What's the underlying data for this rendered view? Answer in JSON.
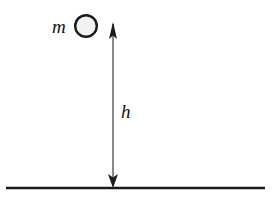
{
  "figure": {
    "name": "projectile-height-diagram",
    "background_color": "#ffffff",
    "ink_color": "#1a1a1a"
  },
  "labels": {
    "mass": "m",
    "height": "h"
  },
  "mass_marker": {
    "name": "mass-circle",
    "shape": "circle",
    "center_x": 86,
    "center_y": 26,
    "radius": 11,
    "fill_color": "#f2f2f2",
    "stroke_color": "#1a1a1a",
    "stroke_width": 2.4
  },
  "height_arrow": {
    "name": "height-dimension-arrow",
    "x": 113,
    "top_y": 22,
    "bottom_y": 188,
    "shaft_color": "#4a4a4a",
    "shaft_width": 1.3,
    "arrowhead_color": "#1a1a1a",
    "top_head_width": 8,
    "top_head_height": 17,
    "bottom_head_width": 10,
    "bottom_head_height": 14,
    "double_headed": true
  },
  "ground_line": {
    "name": "ground-line",
    "x_start": 6,
    "x_end": 265,
    "y": 188,
    "color": "#1a1a1a",
    "thickness": 2.6
  },
  "label_positions": {
    "mass_x": 52,
    "mass_y": 33,
    "height_x": 121,
    "height_y": 118
  }
}
